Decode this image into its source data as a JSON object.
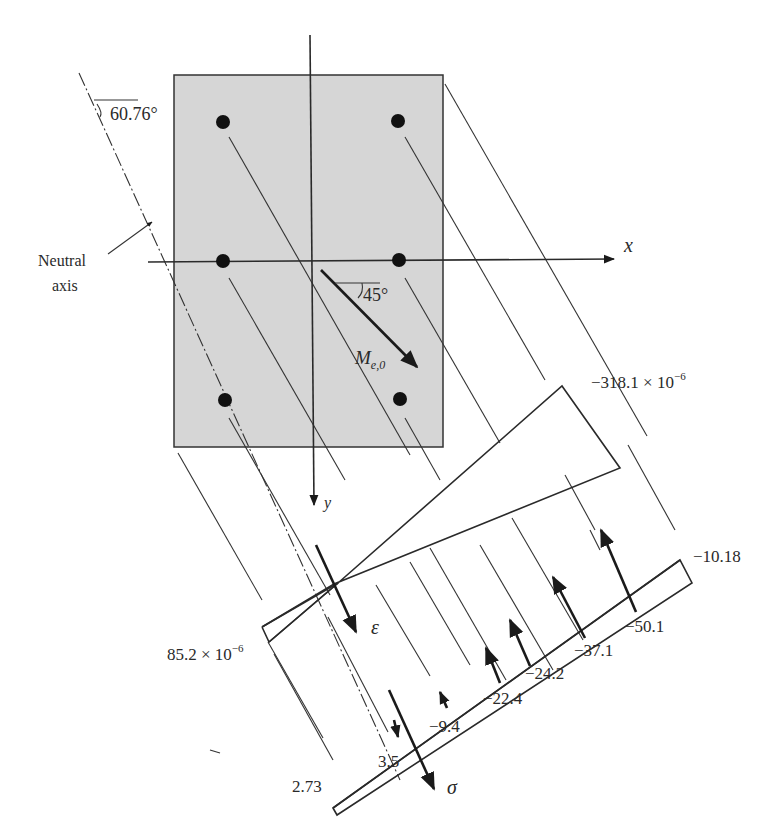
{
  "diagram": {
    "type": "biaxial-bending-section-analysis",
    "section": {
      "fill_color": "#d6d6d6",
      "border_color": "#333333",
      "rebar_count": 6
    },
    "axes": {
      "x_label": "x",
      "y_label": "y"
    },
    "neutral_axis": {
      "label_line1": "Neutral",
      "label_line2": "axis",
      "angle_label": "60.76°"
    },
    "moment": {
      "symbol": "M",
      "subscript": "e,0",
      "angle_label": "45°"
    },
    "strain_diagram": {
      "symbol": "ε",
      "top_value": "−318.1 × 10",
      "top_exponent": "−6",
      "bottom_value": "85.2 × 10",
      "bottom_exponent": "−6"
    },
    "stress_diagram": {
      "symbol": "σ",
      "extreme_compression": "−10.18",
      "extreme_tension": "2.73",
      "bar_forces": [
        "−50.1",
        "−37.1",
        "−24.2",
        "−22.4",
        "−9.4",
        "3.5"
      ]
    }
  }
}
